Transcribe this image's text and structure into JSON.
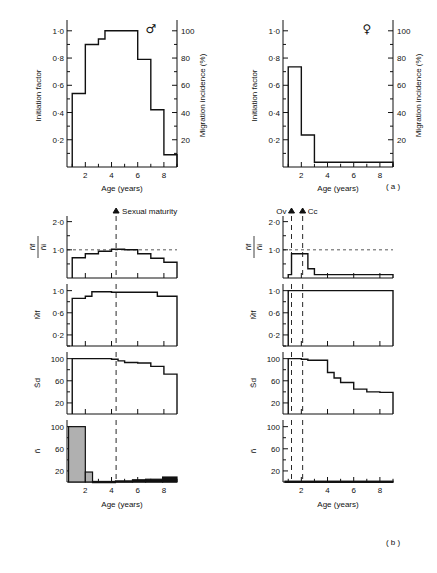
{
  "figure": {
    "panel_a_tag": "( a )",
    "panel_b_tag": "( b )",
    "axis_x_label": "Age (years)",
    "male_symbol": "♂",
    "female_symbol": "♀"
  },
  "panel_a": {
    "left": {
      "sex_symbol": "♂",
      "y_left_label": "Initiation factor",
      "y_right_label": "Migration incidence (%)",
      "x_label": "Age (years)",
      "y_left_ticks": [
        "0·2",
        "0·4",
        "0·6",
        "0·8",
        "1·0"
      ],
      "y_left_values": [
        0.2,
        0.4,
        0.6,
        0.8,
        1.0
      ],
      "y_right_ticks": [
        "20",
        "40",
        "60",
        "80",
        "100"
      ],
      "y_right_values": [
        20,
        40,
        60,
        80,
        100
      ],
      "x_ticks": [
        "2",
        "4",
        "6",
        "8"
      ],
      "x_values": [
        2,
        4,
        6,
        8
      ]
    },
    "right": {
      "sex_symbol": "♀",
      "y_left_label": "Initiation factor",
      "y_right_label": "Migration incidence (%)",
      "x_label": "Age (years)",
      "y_left_ticks": [
        "0·2",
        "0·4",
        "0·6",
        "0·8",
        "1·0"
      ],
      "y_left_values": [
        0.2,
        0.4,
        0.6,
        0.8,
        1.0
      ],
      "y_right_ticks": [
        "20",
        "40",
        "60",
        "80",
        "100"
      ],
      "y_right_values": [
        20,
        40,
        60,
        80,
        100
      ],
      "x_ticks": [
        "2",
        "4",
        "6",
        "8"
      ],
      "x_values": [
        2,
        4,
        6,
        8
      ]
    }
  },
  "panel_b": {
    "left": {
      "annotation": "Sexual maturity",
      "maturity_age": 4.35,
      "x_label": "Age (years)",
      "x_ticks": [
        "2",
        "4",
        "6",
        "8"
      ],
      "x_values": [
        2,
        4,
        6,
        8
      ],
      "subplots": [
        {
          "y_label_num": "ñ",
          "y_label_num_sub": "f",
          "y_label_den": "ñ",
          "y_label_den_sub": "i",
          "y_ticks": [
            "1·0",
            "2·0"
          ],
          "y_values": [
            1.0,
            2.0
          ],
          "ylim": [
            0,
            2.2
          ],
          "reference_line": 1.0
        },
        {
          "y_label_num": "M̄",
          "y_label_num_sub": "f",
          "y_ticks": [
            "0·2",
            "0·6",
            "1·0"
          ],
          "y_values": [
            0.2,
            0.6,
            1.0
          ],
          "ylim": [
            0,
            1.12
          ]
        },
        {
          "y_label_num": "S̄",
          "y_label_num_sub": "d",
          "y_ticks": [
            "20",
            "60",
            "100"
          ],
          "y_values": [
            20,
            60,
            100
          ],
          "ylim": [
            0,
            112
          ]
        },
        {
          "y_label_num": "ñ",
          "y_ticks": [
            "20",
            "60",
            "100"
          ],
          "y_values": [
            20,
            60,
            100
          ],
          "ylim": [
            0,
            112
          ]
        }
      ]
    },
    "right": {
      "marker_1_label": "O",
      "marker_1_sub": "v",
      "marker_1_age": 1.25,
      "marker_2_label": "C",
      "marker_2_sub": "c",
      "marker_2_age": 2.1,
      "x_label": "Age (years)",
      "x_ticks": [
        "2",
        "4",
        "6",
        "8"
      ],
      "x_values": [
        2,
        4,
        6,
        8
      ],
      "subplots": [
        {
          "y_label_num": "ñ",
          "y_label_num_sub": "f",
          "y_label_den": "ñ",
          "y_label_den_sub": "i",
          "y_ticks": [
            "1·0",
            "2·0"
          ],
          "y_values": [
            1.0,
            2.0
          ],
          "ylim": [
            0,
            2.2
          ],
          "reference_line": 1.0
        },
        {
          "y_label_num": "M̄",
          "y_label_num_sub": "f",
          "y_ticks": [
            "0·2",
            "0·6",
            "1·0"
          ],
          "y_values": [
            0.2,
            0.6,
            1.0
          ],
          "ylim": [
            0,
            1.12
          ]
        },
        {
          "y_label_num": "S̄",
          "y_label_num_sub": "d",
          "y_ticks": [
            "20",
            "60",
            "100"
          ],
          "y_values": [
            20,
            60,
            100
          ],
          "ylim": [
            0,
            112
          ]
        },
        {
          "y_label_num": "ñ",
          "y_ticks": [
            "20",
            "60",
            "100"
          ],
          "y_values": [
            20,
            60,
            100
          ],
          "ylim": [
            0,
            112
          ]
        }
      ]
    }
  },
  "chart_data": [
    {
      "id": "a-male",
      "type": "line",
      "title": "Initiation factor / Migration incidence — male",
      "xlabel": "Age (years)",
      "ylabel": "Initiation factor",
      "ylabel_right": "Migration incidence (%)",
      "xlim": [
        0.6,
        9.0
      ],
      "ylim": [
        0,
        1.05
      ],
      "ylim_right": [
        0,
        105
      ],
      "style": "step",
      "bin_edges": [
        1,
        1.5,
        2,
        2.5,
        3,
        3.5,
        4,
        4.5,
        5,
        5.5,
        6,
        6.5,
        7,
        7.5,
        8,
        9
      ],
      "bin_values": [
        0.54,
        0.54,
        0.9,
        0.9,
        0.94,
        1.0,
        1.0,
        1.0,
        1.0,
        1.0,
        0.79,
        0.79,
        0.42,
        0.42,
        0.09
      ]
    },
    {
      "id": "a-female",
      "type": "line",
      "title": "Initiation factor / Migration incidence — female",
      "xlabel": "Age (years)",
      "ylabel": "Initiation factor",
      "ylabel_right": "Migration incidence (%)",
      "xlim": [
        0.6,
        9.0
      ],
      "ylim": [
        0,
        1.05
      ],
      "ylim_right": [
        0,
        105
      ],
      "style": "step",
      "bin_edges": [
        1,
        2,
        3,
        4,
        5,
        6,
        7,
        8,
        9
      ],
      "bin_values": [
        0.735,
        0.235,
        0.035,
        0.035,
        0.035,
        0.035,
        0.035,
        0.035
      ]
    },
    {
      "id": "b-left-nf-ni",
      "type": "line",
      "title": "ñf / ñi — male",
      "xlabel": "Age (years)",
      "ylabel": "ñf / ñi",
      "xlim": [
        0.6,
        9.0
      ],
      "ylim": [
        0,
        2.2
      ],
      "style": "step",
      "reference_line": 1.0,
      "bin_edges": [
        1,
        1.5,
        2,
        2.5,
        3,
        3.5,
        4,
        4.5,
        5,
        5.5,
        6,
        6.5,
        7,
        7.5,
        8,
        9
      ],
      "bin_values": [
        0.72,
        0.72,
        0.86,
        0.86,
        0.95,
        0.95,
        1.02,
        1.02,
        1.0,
        1.0,
        0.86,
        0.86,
        0.7,
        0.7,
        0.56
      ]
    },
    {
      "id": "b-left-Mf",
      "type": "line",
      "title": "M̄f — male",
      "xlabel": "Age (years)",
      "ylabel": "M̄f",
      "xlim": [
        0.6,
        9.0
      ],
      "ylim": [
        0,
        1.12
      ],
      "style": "step",
      "bin_edges": [
        1,
        1.5,
        2,
        2.5,
        3,
        4,
        5,
        6,
        7,
        7.5,
        8,
        9
      ],
      "bin_values": [
        0.86,
        0.86,
        0.9,
        0.98,
        0.98,
        0.97,
        0.97,
        0.97,
        0.97,
        0.9,
        0.9
      ]
    },
    {
      "id": "b-left-Sd",
      "type": "line",
      "title": "S̄d — male",
      "xlabel": "Age (years)",
      "ylabel": "S̄d",
      "xlim": [
        0.6,
        9.0
      ],
      "ylim": [
        0,
        112
      ],
      "style": "step",
      "bin_edges": [
        1,
        2,
        3,
        4,
        4.5,
        5,
        6,
        7,
        8,
        9
      ],
      "bin_values": [
        100,
        100,
        100,
        99,
        96,
        93,
        92,
        86,
        72
      ]
    },
    {
      "id": "b-left-n",
      "type": "bar",
      "title": "ñ — male",
      "xlabel": "Age (years)",
      "ylabel": "ñ",
      "xlim": [
        0.6,
        9.0
      ],
      "ylim": [
        0,
        112
      ],
      "bars": [
        {
          "x0": 0.72,
          "x1": 2.0,
          "value": 100,
          "fill": "gray"
        },
        {
          "x0": 2.0,
          "x1": 2.55,
          "value": 18,
          "fill": "gray"
        },
        {
          "x0": 2.55,
          "x1": 4.3,
          "value": 1,
          "fill": "gray"
        },
        {
          "x0": 4.3,
          "x1": 5.6,
          "value": 2,
          "fill": "black"
        },
        {
          "x0": 5.6,
          "x1": 6.6,
          "value": 4,
          "fill": "black"
        },
        {
          "x0": 6.6,
          "x1": 7.9,
          "value": 5,
          "fill": "black"
        },
        {
          "x0": 7.9,
          "x1": 9.0,
          "value": 9,
          "fill": "black"
        }
      ]
    },
    {
      "id": "b-right-nf-ni",
      "type": "line",
      "title": "ñf / ñi — female",
      "xlabel": "Age (years)",
      "ylabel": "ñf / ñi",
      "xlim": [
        0.6,
        9.0
      ],
      "ylim": [
        0,
        2.2
      ],
      "style": "step",
      "reference_line": 1.0,
      "bin_edges": [
        1,
        1.25,
        2,
        2.5,
        3,
        4,
        5,
        6,
        7,
        8,
        9
      ],
      "bin_values": [
        0.12,
        0.86,
        0.86,
        0.33,
        0.12,
        0.12,
        0.12,
        0.12,
        0.12,
        0.12
      ]
    },
    {
      "id": "b-right-Mf",
      "type": "line",
      "title": "M̄f — female",
      "xlabel": "Age (years)",
      "ylabel": "M̄f",
      "xlim": [
        0.6,
        9.0
      ],
      "ylim": [
        0,
        1.12
      ],
      "style": "step",
      "bin_edges": [
        1,
        2,
        3,
        4,
        5,
        6,
        7,
        8,
        9
      ],
      "bin_values": [
        1.0,
        1.0,
        1.0,
        1.0,
        1.0,
        1.0,
        1.0,
        1.0
      ]
    },
    {
      "id": "b-right-Sd",
      "type": "line",
      "title": "S̄d — female",
      "xlabel": "Age (years)",
      "ylabel": "S̄d",
      "xlim": [
        0.6,
        9.0
      ],
      "ylim": [
        0,
        112
      ],
      "style": "step",
      "bin_edges": [
        1,
        2,
        2.5,
        3,
        4,
        4.5,
        5,
        6,
        7,
        8,
        9
      ],
      "bin_values": [
        100,
        99,
        97,
        97,
        75,
        65,
        57,
        45,
        40,
        39
      ]
    },
    {
      "id": "b-right-n",
      "type": "bar",
      "title": "ñ — female",
      "xlabel": "Age (years)",
      "ylabel": "ñ",
      "xlim": [
        0.6,
        9.0
      ],
      "ylim": [
        0,
        112
      ],
      "bars": [
        {
          "x0": 0.75,
          "x1": 9.0,
          "value": 1.5,
          "fill": "black"
        }
      ]
    }
  ]
}
